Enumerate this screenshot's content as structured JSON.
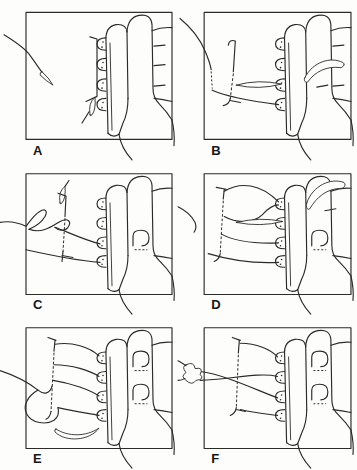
{
  "figure": {
    "panel_labels": [
      "A",
      "B",
      "C",
      "D",
      "E",
      "F"
    ],
    "panels": [
      {
        "label": "A",
        "elements": "free suture with needle tip, vertical tissue-edge bracket, detached needle, hand holding four-hook splint"
      },
      {
        "label": "B",
        "elements": "suture entering from left to lowest hook, straight needle at third hook, curled suture end at right"
      },
      {
        "label": "C",
        "elements": "suture looped mid-field to third and fourth hooks, small needle above dashed tissue edge"
      },
      {
        "label": "D",
        "elements": "wide suture loops over upper hooks, straight needle at second hook, curled suture end upper right"
      },
      {
        "label": "E",
        "elements": "four suture strands fanned from dashed tissue edge to hooks, loop and curved needle below"
      },
      {
        "label": "F",
        "elements": "crossed suture strands from hooks, knot being tied at left edge of field"
      }
    ]
  },
  "colors": {
    "ink": "#2b2b28",
    "paper": "#fdfdfb"
  }
}
